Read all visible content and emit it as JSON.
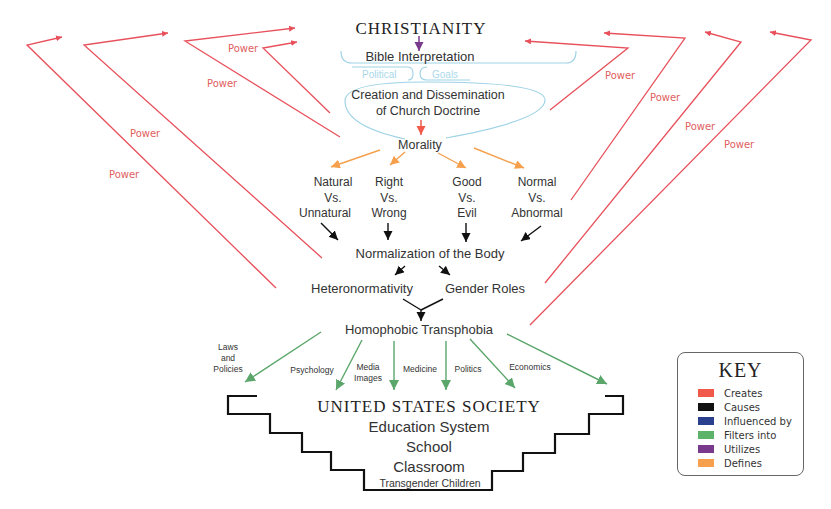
{
  "title": "CHRISTIANITY",
  "nodes": {
    "bible": "Bible Interpretation",
    "political": "Political",
    "goals": "Goals",
    "doctrine_line1": "Creation and Dissemination",
    "doctrine_line2": "of Church Doctrine",
    "morality": "Morality",
    "dichotomies": [
      {
        "l1": "Natural",
        "l2": "Vs.",
        "l3": "Unnatural"
      },
      {
        "l1": "Right",
        "l2": "Vs.",
        "l3": "Wrong"
      },
      {
        "l1": "Good",
        "l2": "Vs.",
        "l3": "Evil"
      },
      {
        "l1": "Normal",
        "l2": "Vs.",
        "l3": "Abnormal"
      }
    ],
    "normalization": "Normalization of the Body",
    "heteronormativity": "Heteronormativity",
    "gender_roles": "Gender Roles",
    "homophobic": "Homophobic Transphobia",
    "channels": {
      "laws": [
        "Laws",
        "and",
        "Policies"
      ],
      "psychology": "Psychology",
      "media": [
        "Media",
        "Images"
      ],
      "medicine": "Medicine",
      "politics": "Politics",
      "economics": "Economics"
    },
    "society": "UNITED STATES SOCIETY",
    "education": "Education System",
    "school": "School",
    "classroom": "Classroom",
    "children": "Transgender Children"
  },
  "power_label": "Power",
  "power_labels": [
    "Power",
    "Power",
    "Power",
    "Power",
    "Power",
    "Power",
    "Power",
    "Power"
  ],
  "key": {
    "title": "KEY",
    "items": [
      {
        "label": "Creates",
        "color": "#f15a4a"
      },
      {
        "label": "Causes",
        "color": "#111111"
      },
      {
        "label": "Influenced by",
        "color": "#2b3f8f"
      },
      {
        "label": "Filters into",
        "color": "#5db36a"
      },
      {
        "label": "Utilizes",
        "color": "#7a3a8c"
      },
      {
        "label": "Defines",
        "color": "#f6a04d"
      }
    ]
  },
  "colors": {
    "power_red": "#e8505b",
    "defines_orange": "#f6a04d",
    "filters_green": "#5ba66b",
    "utilizes_purple": "#7a3a8c",
    "creates_red": "#f15a4a",
    "bubble_blue": "#9fd3e6",
    "causes_black": "#111111"
  }
}
